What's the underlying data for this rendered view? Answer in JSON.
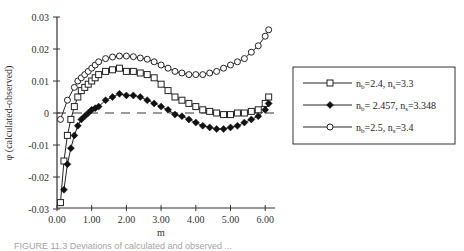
{
  "chart_data": {
    "type": "line",
    "title": "",
    "xlabel": "m",
    "ylabel": "φ (calculated-observed)",
    "xlim": [
      0,
      6.2
    ],
    "ylim": [
      -0.03,
      0.03
    ],
    "x_ticks": [
      "0.00",
      "1.00",
      "2.00",
      "3.00",
      "4.00",
      "5.00",
      "6.00"
    ],
    "y_ticks": [
      "0.03",
      "0.02",
      "0.01",
      "0",
      "-0.01",
      "-0.02",
      "-0.03"
    ],
    "grid": false,
    "reference_line": {
      "y": 0,
      "style": "dashed"
    },
    "legend_position": "right",
    "series": [
      {
        "name": "nb=2.4, ns=3.3",
        "legend": {
          "main1": "n",
          "sub1": "b",
          "mid": "=2.4, n",
          "sub2": "s",
          "end": "=3.3"
        },
        "marker": "square-open",
        "x": [
          0.1,
          0.2,
          0.3,
          0.4,
          0.5,
          0.6,
          0.7,
          0.8,
          0.9,
          1.0,
          1.1,
          1.2,
          1.4,
          1.6,
          1.8,
          2.0,
          2.2,
          2.4,
          2.6,
          2.8,
          3.0,
          3.2,
          3.4,
          3.6,
          3.8,
          4.0,
          4.2,
          4.4,
          4.6,
          4.8,
          5.0,
          5.2,
          5.4,
          5.6,
          5.8,
          6.0,
          6.1
        ],
        "y": [
          -0.028,
          -0.015,
          -0.007,
          -0.002,
          0.002,
          0.005,
          0.007,
          0.008,
          0.009,
          0.01,
          0.011,
          0.012,
          0.013,
          0.0135,
          0.014,
          0.013,
          0.013,
          0.0125,
          0.012,
          0.011,
          0.009,
          0.007,
          0.005,
          0.004,
          0.003,
          0.002,
          0.001,
          0.0005,
          0.0,
          -0.0005,
          -0.0005,
          0.0,
          0.0,
          0.0005,
          0.001,
          0.003,
          0.005
        ]
      },
      {
        "name": "nb= 2.457, ns=3.348",
        "legend": {
          "main1": "n",
          "sub1": "b",
          "mid": "= 2.457, n",
          "sub2": "s",
          "end": "=3.348"
        },
        "marker": "diamond-filled",
        "x": [
          0.2,
          0.3,
          0.4,
          0.5,
          0.6,
          0.7,
          0.8,
          0.9,
          1.0,
          1.1,
          1.2,
          1.4,
          1.6,
          1.8,
          2.0,
          2.2,
          2.4,
          2.6,
          2.8,
          3.0,
          3.2,
          3.4,
          3.6,
          3.8,
          4.0,
          4.2,
          4.4,
          4.6,
          4.8,
          5.0,
          5.2,
          5.4,
          5.6,
          5.8,
          6.0,
          6.1
        ],
        "y": [
          -0.024,
          -0.016,
          -0.011,
          -0.007,
          -0.004,
          -0.002,
          -0.001,
          0.0,
          0.001,
          0.0015,
          0.002,
          0.004,
          0.005,
          0.006,
          0.0055,
          0.0055,
          0.005,
          0.004,
          0.003,
          0.002,
          0.001,
          -0.0005,
          -0.001,
          -0.002,
          -0.003,
          -0.004,
          -0.0045,
          -0.005,
          -0.005,
          -0.0045,
          -0.004,
          -0.003,
          -0.002,
          -0.001,
          0.001,
          0.003
        ]
      },
      {
        "name": "nb=2.5, ns=3.4",
        "legend": {
          "main1": "n",
          "sub1": "b",
          "mid": "=2.5, n",
          "sub2": "s",
          "end": "=3.4"
        },
        "marker": "circle-open",
        "x": [
          0.1,
          0.3,
          0.5,
          0.6,
          0.7,
          0.8,
          0.9,
          1.0,
          1.1,
          1.2,
          1.4,
          1.6,
          1.8,
          2.0,
          2.2,
          2.4,
          2.6,
          2.8,
          3.0,
          3.2,
          3.4,
          3.6,
          3.8,
          4.0,
          4.2,
          4.4,
          4.6,
          4.8,
          5.0,
          5.2,
          5.4,
          5.6,
          5.8,
          6.0,
          6.1
        ],
        "y": [
          -0.002,
          0.004,
          0.008,
          0.01,
          0.011,
          0.012,
          0.013,
          0.014,
          0.015,
          0.016,
          0.017,
          0.0175,
          0.0178,
          0.0178,
          0.0176,
          0.0172,
          0.0168,
          0.016,
          0.015,
          0.014,
          0.013,
          0.0125,
          0.012,
          0.012,
          0.012,
          0.0125,
          0.013,
          0.014,
          0.015,
          0.016,
          0.017,
          0.019,
          0.021,
          0.024,
          0.026
        ]
      }
    ]
  },
  "caption": "FIGURE 11.3 Deviations of calculated and observed ..."
}
